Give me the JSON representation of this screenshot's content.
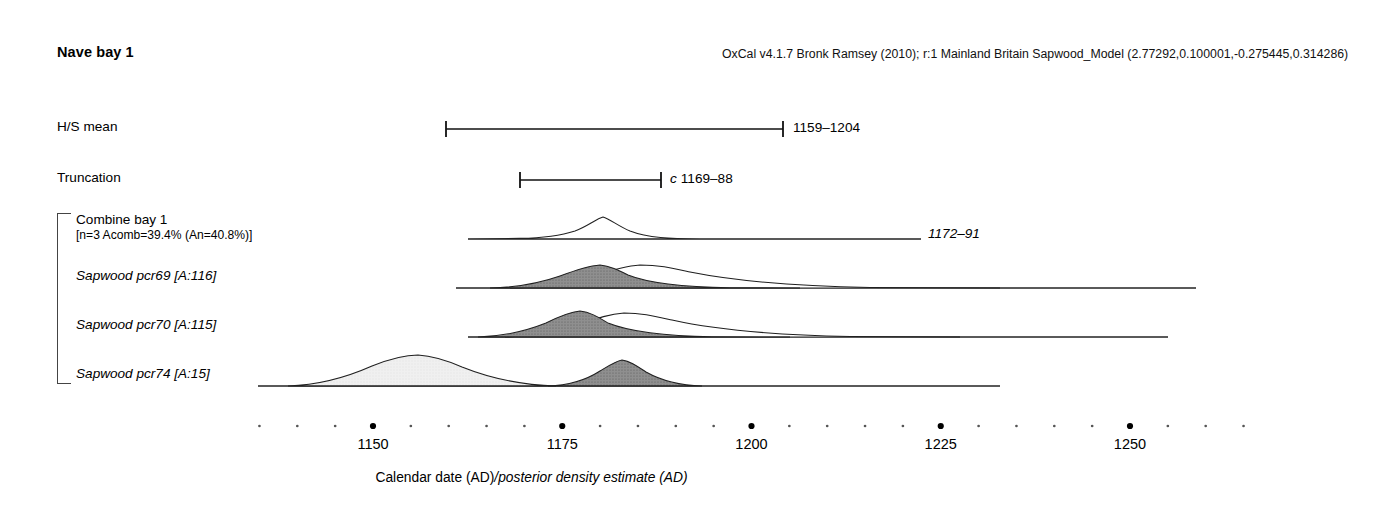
{
  "plot": {
    "title": "Nave bay 1",
    "credit": "OxCal v4.1.7 Bronk Ramsey (2010); r:1 Mainland Britain Sapwood_Model (2.77292,0.100001,-0.275445,0.314286)"
  },
  "axis": {
    "label_roman": "Calendar date (AD)",
    "label_italic": "/posterior density estimate (AD)",
    "tick_labels": [
      "1150",
      "1175",
      "1200",
      "1225",
      "1250"
    ],
    "major_ticks": [
      1150,
      1175,
      1200,
      1225,
      1250
    ],
    "minor_step": 5,
    "range": [
      1134,
      1269
    ]
  },
  "rows": [
    {
      "name": "hs-mean",
      "label": "H/S mean",
      "label_italic": false,
      "type": "range-bar",
      "bar_start": 1159,
      "bar_end": 1204,
      "annotation": "1159–1204",
      "annotation_italic": false,
      "annotation_prefix": ""
    },
    {
      "name": "truncation",
      "label": "Truncation",
      "label_italic": false,
      "type": "range-bar",
      "bar_start": 1169,
      "bar_end": 1188,
      "annotation": "1169–88",
      "annotation_italic": false,
      "annotation_prefix": "c"
    },
    {
      "name": "combine-bay-1",
      "label": "Combine bay 1",
      "sub_label": "[n=3 Acomb=39.4% (An=40.8%)]",
      "label_italic": false,
      "type": "distribution",
      "annotation": "1172–91",
      "annotation_italic": true,
      "annotation_prefix": ""
    },
    {
      "name": "sapwood-pcr69",
      "label": "Sapwood pcr69 [A:116]",
      "label_italic": true,
      "type": "distribution",
      "annotation": "",
      "annotation_italic": false,
      "annotation_prefix": ""
    },
    {
      "name": "sapwood-pcr70",
      "label": "Sapwood pcr70 [A:115]",
      "label_italic": true,
      "type": "distribution",
      "annotation": "",
      "annotation_italic": false,
      "annotation_prefix": ""
    },
    {
      "name": "sapwood-pcr74",
      "label": "Sapwood pcr74 [A:15]",
      "label_italic": true,
      "type": "distribution",
      "annotation": "",
      "annotation_italic": false,
      "annotation_prefix": ""
    }
  ],
  "colors": {
    "posterior_fill": "#8c8c8c",
    "prior_fill": "#efefef",
    "outline": "#1a1a1a",
    "axis": "#000000"
  },
  "chart_data": {
    "type": "area",
    "title": "Nave bay 1",
    "xlabel": "Calendar date (AD)/posterior density estimate (AD)",
    "ylabel": "",
    "xlim": [
      1134,
      1269
    ],
    "grid": false,
    "legend": "none",
    "series": [
      {
        "name": "H/S mean",
        "kind": "range",
        "start": 1159,
        "end": 1204,
        "label": "1159–1204"
      },
      {
        "name": "Truncation",
        "kind": "range",
        "start": 1169,
        "end": 1188,
        "label": "c 1169–88"
      },
      {
        "name": "Combine bay 1 posterior",
        "kind": "density-outline",
        "label": "1172–91",
        "baseline_start": 1134,
        "baseline_end": 1255,
        "peak": 1181,
        "points": [
          [
            1158,
            0.0
          ],
          [
            1163,
            0.05
          ],
          [
            1168,
            0.18
          ],
          [
            1172,
            0.42
          ],
          [
            1176,
            0.72
          ],
          [
            1181,
            1.0
          ],
          [
            1186,
            0.82
          ],
          [
            1191,
            0.5
          ],
          [
            1196,
            0.22
          ],
          [
            1201,
            0.07
          ],
          [
            1206,
            0.0
          ]
        ]
      },
      {
        "name": "Sapwood pcr69 prior",
        "kind": "density-outline",
        "baseline_start": 1134,
        "baseline_end": 1272,
        "peak": 1190,
        "points": [
          [
            1164,
            0.0
          ],
          [
            1170,
            0.1
          ],
          [
            1176,
            0.32
          ],
          [
            1182,
            0.62
          ],
          [
            1188,
            0.8
          ],
          [
            1192,
            0.8
          ],
          [
            1198,
            0.66
          ],
          [
            1206,
            0.44
          ],
          [
            1216,
            0.24
          ],
          [
            1228,
            0.11
          ],
          [
            1242,
            0.04
          ],
          [
            1258,
            0.0
          ]
        ]
      },
      {
        "name": "Sapwood pcr69 posterior",
        "kind": "density-filled",
        "baseline_start": 1134,
        "baseline_end": 1272,
        "peak": 1183,
        "points": [
          [
            1161,
            0.0
          ],
          [
            1166,
            0.12
          ],
          [
            1171,
            0.35
          ],
          [
            1176,
            0.62
          ],
          [
            1181,
            0.82
          ],
          [
            1184,
            0.84
          ],
          [
            1189,
            0.72
          ],
          [
            1195,
            0.48
          ],
          [
            1202,
            0.26
          ],
          [
            1212,
            0.11
          ],
          [
            1224,
            0.04
          ],
          [
            1240,
            0.0
          ]
        ]
      },
      {
        "name": "Sapwood pcr70 prior",
        "kind": "density-outline",
        "baseline_start": 1134,
        "baseline_end": 1264,
        "peak": 1186,
        "points": [
          [
            1160,
            0.0
          ],
          [
            1166,
            0.14
          ],
          [
            1172,
            0.4
          ],
          [
            1178,
            0.68
          ],
          [
            1184,
            0.8
          ],
          [
            1188,
            0.8
          ],
          [
            1194,
            0.66
          ],
          [
            1202,
            0.44
          ],
          [
            1212,
            0.24
          ],
          [
            1224,
            0.11
          ],
          [
            1238,
            0.04
          ],
          [
            1254,
            0.0
          ]
        ]
      },
      {
        "name": "Sapwood pcr70 posterior",
        "kind": "density-filled",
        "baseline_start": 1134,
        "baseline_end": 1264,
        "peak": 1178,
        "points": [
          [
            1156,
            0.0
          ],
          [
            1161,
            0.14
          ],
          [
            1166,
            0.42
          ],
          [
            1172,
            0.72
          ],
          [
            1177,
            0.86
          ],
          [
            1180,
            0.86
          ],
          [
            1185,
            0.7
          ],
          [
            1191,
            0.46
          ],
          [
            1198,
            0.24
          ],
          [
            1208,
            0.1
          ],
          [
            1220,
            0.03
          ],
          [
            1236,
            0.0
          ]
        ]
      },
      {
        "name": "Sapwood pcr74 prior",
        "kind": "density-filled-light",
        "baseline_start": 1134,
        "baseline_end": 1232,
        "peak": 1151,
        "points": [
          [
            1136,
            0.0
          ],
          [
            1140,
            0.18
          ],
          [
            1144,
            0.44
          ],
          [
            1148,
            0.66
          ],
          [
            1152,
            0.72
          ],
          [
            1156,
            0.7
          ],
          [
            1161,
            0.6
          ],
          [
            1166,
            0.44
          ],
          [
            1171,
            0.26
          ],
          [
            1175,
            0.12
          ],
          [
            1179,
            0.0
          ]
        ]
      },
      {
        "name": "Sapwood pcr74 posterior",
        "kind": "density-filled",
        "baseline_start": 1134,
        "baseline_end": 1232,
        "peak": 1182,
        "points": [
          [
            1169,
            0.0
          ],
          [
            1173,
            0.18
          ],
          [
            1177,
            0.52
          ],
          [
            1181,
            0.8
          ],
          [
            1184,
            0.82
          ],
          [
            1188,
            0.66
          ],
          [
            1192,
            0.42
          ],
          [
            1196,
            0.22
          ],
          [
            1200,
            0.08
          ],
          [
            1205,
            0.0
          ]
        ]
      }
    ]
  }
}
